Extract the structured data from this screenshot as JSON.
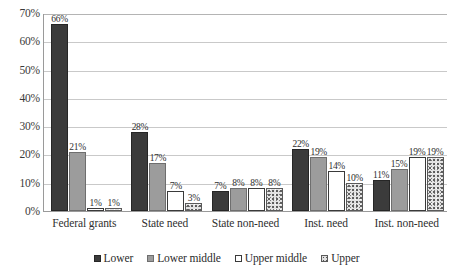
{
  "chart_data": {
    "type": "bar",
    "title": "",
    "subtitle": "",
    "xlabel": "",
    "ylabel": "",
    "ylim": [
      0,
      70
    ],
    "y_tick_labels": [
      "70%",
      "60%",
      "50%",
      "40%",
      "30%",
      "20%",
      "10%",
      "0%"
    ],
    "y_ticks": [
      70,
      60,
      50,
      40,
      30,
      20,
      10,
      0
    ],
    "grid": true,
    "legend_position": "bottom",
    "value_label_suffix": "%",
    "categories": [
      "Federal grants",
      "State need",
      "State non-need",
      "Inst. need",
      "Inst. non-need"
    ],
    "series": [
      {
        "name": "Lower",
        "key": "series-lower",
        "color": "#3b3b3b",
        "values": [
          66,
          28,
          7,
          22,
          11
        ],
        "labels": [
          "66%",
          "28%",
          "7%",
          "22%",
          "11%"
        ]
      },
      {
        "name": "Lower middle",
        "key": "series-lower-middle",
        "color": "#9c9c9c",
        "values": [
          21,
          17,
          8,
          19,
          15
        ],
        "labels": [
          "21%",
          "17%",
          "8%",
          "19%",
          "15%"
        ]
      },
      {
        "name": "Upper middle",
        "key": "series-upper-middle",
        "color": "#ffffff",
        "values": [
          1,
          7,
          8,
          14,
          19
        ],
        "labels": [
          "1%",
          "7%",
          "8%",
          "14%",
          "19%"
        ]
      },
      {
        "name": "Upper",
        "key": "series-upper",
        "color": "#e3e3e3",
        "values": [
          1,
          3,
          8,
          10,
          19
        ],
        "labels": [
          "1%",
          "3%",
          "8%",
          "10%",
          "19%"
        ]
      }
    ]
  }
}
